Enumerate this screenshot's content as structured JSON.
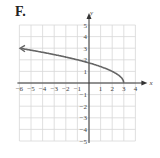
{
  "panel_label": "F.",
  "chart_data": {
    "type": "line",
    "title": "",
    "xlabel": "x",
    "ylabel": "y",
    "xlim": [
      -6,
      4
    ],
    "ylim": [
      -5,
      5
    ],
    "grid": true,
    "x_ticks": [
      -6,
      -5,
      -4,
      -3,
      -2,
      -1,
      1,
      2,
      3,
      4
    ],
    "y_ticks": [
      5,
      4,
      3,
      2,
      1,
      -1,
      -2,
      -3,
      -4,
      -5
    ],
    "series": [
      {
        "name": "y = sqrt(3 - x)",
        "x": [
          3,
          2.75,
          2,
          1,
          0,
          -1,
          -2,
          -3,
          -4,
          -5,
          -6
        ],
        "y": [
          0,
          0.5,
          1,
          1.41,
          1.73,
          2,
          2.24,
          2.45,
          2.65,
          2.83,
          3
        ],
        "left_arrow": true,
        "color": "#666666"
      }
    ]
  }
}
